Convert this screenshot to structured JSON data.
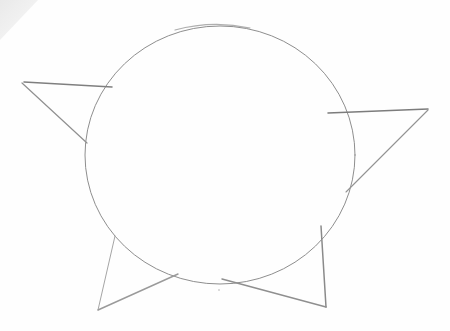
{
  "image": {
    "subject": "pencil sketch of a circle with four triangular spikes",
    "background_color": "#fefefe",
    "pencil_color": "#8a8a8a",
    "shade_color": "#e6e6e6"
  },
  "shapes": {
    "circle": {
      "cx": 220,
      "cy": 155,
      "rx": 135,
      "ry": 129
    },
    "spikes": [
      {
        "name": "left",
        "points": [
          [
            108,
            86
          ],
          [
            22,
            82
          ],
          [
            86,
            143
          ]
        ]
      },
      {
        "name": "right",
        "points": [
          [
            330,
            112
          ],
          [
            428,
            110
          ],
          [
            348,
            190
          ]
        ]
      },
      {
        "name": "bottom-left",
        "points": [
          [
            115,
            238
          ],
          [
            98,
            310
          ],
          [
            178,
            275
          ]
        ]
      },
      {
        "name": "bottom-right",
        "points": [
          [
            322,
            226
          ],
          [
            327,
            307
          ],
          [
            225,
            278
          ]
        ]
      }
    ]
  }
}
